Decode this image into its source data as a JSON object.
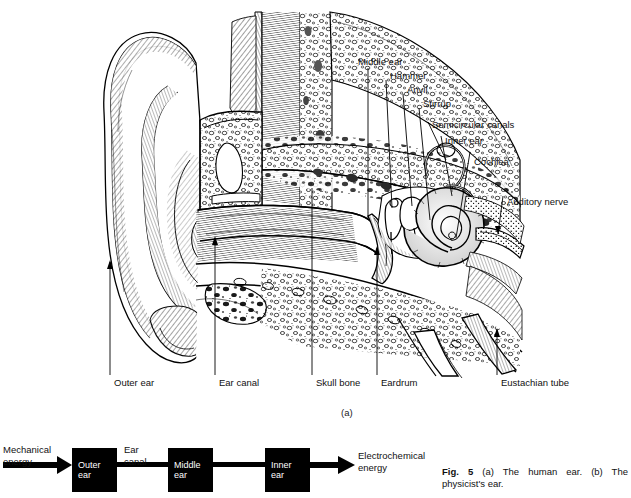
{
  "figure": {
    "panel_a_letter": "(a)",
    "caption_bold": "Fig. 5",
    "caption_text": "(a) The human ear. (b) The physicist's ear."
  },
  "diagram_a": {
    "title_hint": "human-ear-cross-section",
    "top_labels": [
      {
        "key": "middle_ear",
        "text": "Middle ear"
      },
      {
        "key": "hammer",
        "text": "Hammer"
      },
      {
        "key": "anvil",
        "text": "Anvil"
      },
      {
        "key": "stirrup",
        "text": "Stirrup"
      },
      {
        "key": "semicircular_canals",
        "text": "Semicircular canals"
      },
      {
        "key": "inner_ear",
        "text": "Inner ear"
      },
      {
        "key": "cochlea",
        "text": "Cochlea"
      },
      {
        "key": "auditory_nerve",
        "text": "Auditory nerve"
      }
    ],
    "bottom_labels": [
      {
        "key": "outer_ear",
        "text": "Outer ear"
      },
      {
        "key": "ear_canal",
        "text": "Ear canal"
      },
      {
        "key": "skull_bone",
        "text": "Skull bone"
      },
      {
        "key": "eardrum",
        "text": "Eardrum"
      },
      {
        "key": "eustachian_tube",
        "text": "Eustachian tube"
      }
    ]
  },
  "diagram_b": {
    "input_label_line1": "Mechanical",
    "input_label_line2": "energy",
    "output_label_line1": "Electrochemical",
    "output_label_line2": "energy",
    "between_label_line1": "Ear",
    "between_label_line2": "canal",
    "boxes": [
      {
        "key": "outer",
        "line1": "Outer",
        "line2": "ear"
      },
      {
        "key": "middle",
        "line1": "Middle",
        "line2": "ear"
      },
      {
        "key": "inner",
        "line1": "Inner",
        "line2": "ear"
      }
    ]
  },
  "colors": {
    "ink": "#000000",
    "paper": "#ffffff",
    "label_text": "#111111"
  }
}
